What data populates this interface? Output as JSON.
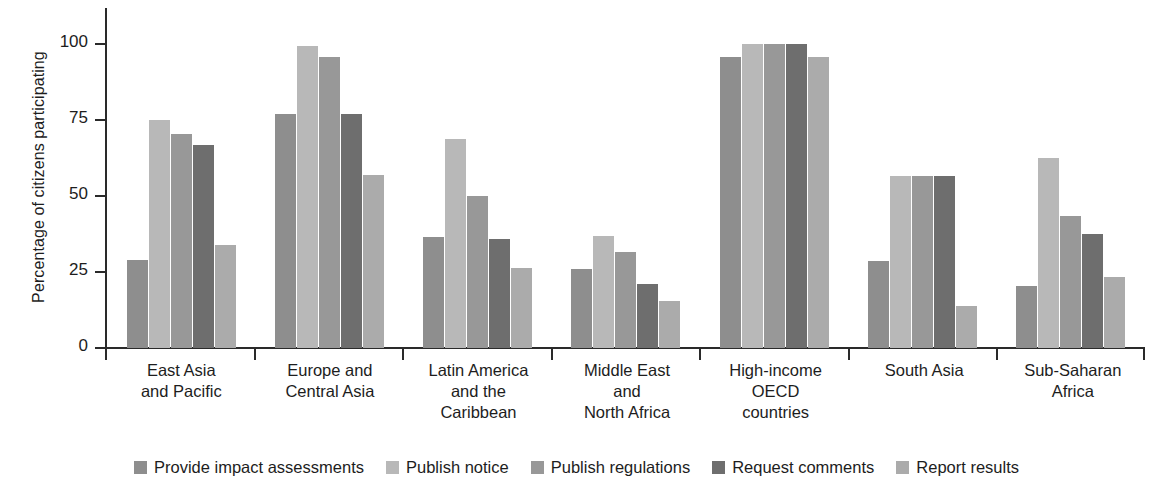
{
  "chart_data": {
    "type": "bar",
    "title": "",
    "subtitle": "",
    "xlabel": "",
    "ylabel": "Percentage of citizens participating",
    "ylim": [
      0,
      112
    ],
    "yticks": [
      0,
      25,
      50,
      75,
      100
    ],
    "ytick_labels": [
      "0",
      "25",
      "50",
      "75",
      "100"
    ],
    "grid": false,
    "legend_position": "bottom",
    "categories": [
      "East Asia\nand Pacific",
      "Europe and\nCentral Asia",
      "Latin America\nand the\nCaribbean",
      "Middle East\nand\nNorth Africa",
      "High-income\nOECD\ncountries",
      "South Asia",
      "Sub-Saharan\nAfrica"
    ],
    "category_lines": [
      [
        "East Asia",
        "and Pacific"
      ],
      [
        "Europe and",
        "Central Asia"
      ],
      [
        "Latin America",
        "and the",
        "Caribbean"
      ],
      [
        "Middle East",
        "and",
        "North Africa"
      ],
      [
        "High-income",
        "OECD",
        "countries"
      ],
      [
        "South Asia"
      ],
      [
        "Sub-Saharan",
        "Africa"
      ]
    ],
    "series": [
      {
        "name": "Provide impact assessments",
        "color": "#8e8e8e",
        "values": [
          29,
          77,
          36.5,
          26,
          96,
          28.5,
          20.5
        ]
      },
      {
        "name": "Publish notice",
        "color": "#b8b8b8",
        "values": [
          75,
          99.5,
          69,
          37,
          100,
          56.5,
          62.5
        ]
      },
      {
        "name": "Publish regulations",
        "color": "#989898",
        "values": [
          70.5,
          96,
          50,
          31.5,
          100,
          56.5,
          43.5
        ]
      },
      {
        "name": "Request comments",
        "color": "#6e6e6e",
        "values": [
          67,
          77,
          36,
          21,
          100,
          56.5,
          37.5
        ]
      },
      {
        "name": "Report results",
        "color": "#ababab",
        "values": [
          34,
          57,
          26.5,
          15.5,
          96,
          14,
          23.5
        ]
      }
    ]
  }
}
